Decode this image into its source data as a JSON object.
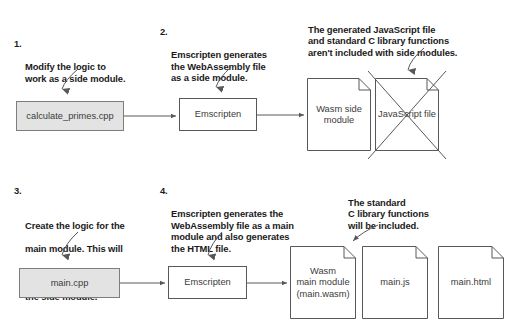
{
  "diagram": {
    "colors": {
      "stroke": "#58585a",
      "shaded_fill": "#e3e3e3",
      "text": "#1a1a1a",
      "box_text": "#3b3b3b",
      "background": "#ffffff"
    },
    "annotations": [
      {
        "id": "step-1",
        "number": "1.",
        "text": "Modify the logic to\nwork as a side module."
      },
      {
        "id": "step-2",
        "number": "2.",
        "text": "Emscripten generates\nthe WebAssembly file\nas a side module."
      },
      {
        "id": "note-js-excluded",
        "number": "",
        "text": "The generated JavaScript file\nand standard C library functions\naren't included with side modules."
      },
      {
        "id": "step-3",
        "number": "3.",
        "text_parts": [
          "Create the logic for the",
          "main module. This will",
          "call ",
          "dlopen",
          " to link to",
          "the side module."
        ],
        "line1": "Create the logic for the",
        "line2": "main module. This will",
        "line3_pre": "call ",
        "line3_mono": "dlopen",
        "line3_post": " to link to",
        "line4": "the side module."
      },
      {
        "id": "step-4",
        "number": "4.",
        "text": "Emscripten generates the\nWebAssembly file as a main\nmodule and also generates\nthe HTML file."
      },
      {
        "id": "note-c-included",
        "number": "",
        "text": "The standard\nC library functions\nwill be included."
      }
    ],
    "nodes": {
      "source_side": {
        "label": "calculate_primes.cpp",
        "style": "shaded"
      },
      "compiler_top": {
        "label": "Emscripten",
        "style": "plain"
      },
      "wasm_side_module": {
        "label": "Wasm side\nmodule",
        "style": "file"
      },
      "javascript_file": {
        "label": "JavaScript file",
        "style": "file-crossed-out"
      },
      "source_main": {
        "label": "main.cpp",
        "style": "shaded"
      },
      "compiler_bottom": {
        "label": "Emscripten",
        "style": "plain"
      },
      "wasm_main_module": {
        "label": "Wasm\nmain module\n(main.wasm)",
        "style": "file"
      },
      "main_js": {
        "label": "main.js",
        "style": "file"
      },
      "main_html": {
        "label": "main.html",
        "style": "file"
      }
    }
  }
}
